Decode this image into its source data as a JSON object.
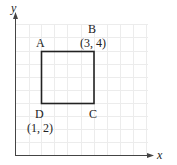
{
  "diagram": {
    "type": "coordinate-grid",
    "axes": {
      "x_label": "x",
      "y_label": "y"
    },
    "shape": "square",
    "vertices": [
      {
        "name": "A",
        "coord": ""
      },
      {
        "name": "B",
        "coord": "(3, 4)"
      },
      {
        "name": "C",
        "coord": ""
      },
      {
        "name": "D",
        "coord": "(1, 2)"
      }
    ],
    "colors": {
      "grid": "#ececec",
      "axis": "#444444",
      "shape": "#222222"
    }
  }
}
